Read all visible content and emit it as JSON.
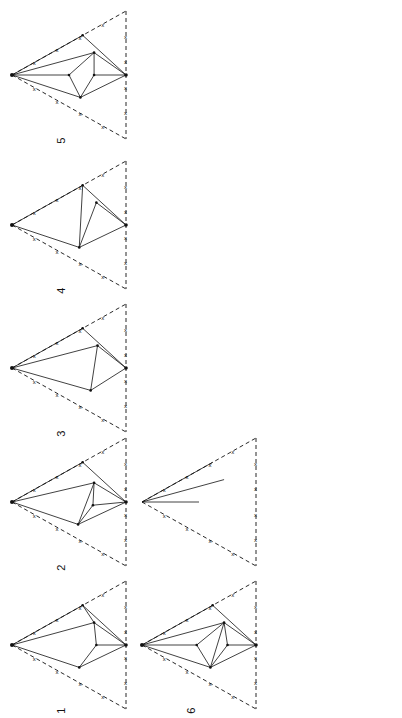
{
  "figure": {
    "panel_label": "(b)",
    "layout": "3 columns x 5 rows, rotated 90 degrees counter-clockwise",
    "colors": {
      "ink": "#111111",
      "background": "#ffffff"
    },
    "stray_marks": [
      "?",
      "*"
    ],
    "diagrams": [
      {
        "number": "1",
        "column": 0,
        "row": 0
      },
      {
        "number": "2",
        "column": 0,
        "row": 1
      },
      {
        "number": "3",
        "column": 0,
        "row": 2
      },
      {
        "number": "4",
        "column": 0,
        "row": 3
      },
      {
        "number": "5",
        "column": 0,
        "row": 4
      },
      {
        "number": "6",
        "column": 1,
        "row": 0
      },
      {
        "number": "7",
        "column": 1,
        "row": 1
      },
      {
        "number": "8",
        "column": 1,
        "row": 2
      },
      {
        "number": "9",
        "column": 1,
        "row": 3
      },
      {
        "number": "10",
        "column": 1,
        "row": 4
      },
      {
        "number": "11",
        "column": 2,
        "row": 0
      },
      {
        "number": "12",
        "column": 2,
        "row": 1
      },
      {
        "number": "13",
        "column": 2,
        "row": 2
      },
      {
        "number": "14",
        "column": 2,
        "row": 3
      },
      {
        "number": "15",
        "column": 2,
        "row": 4
      }
    ]
  }
}
